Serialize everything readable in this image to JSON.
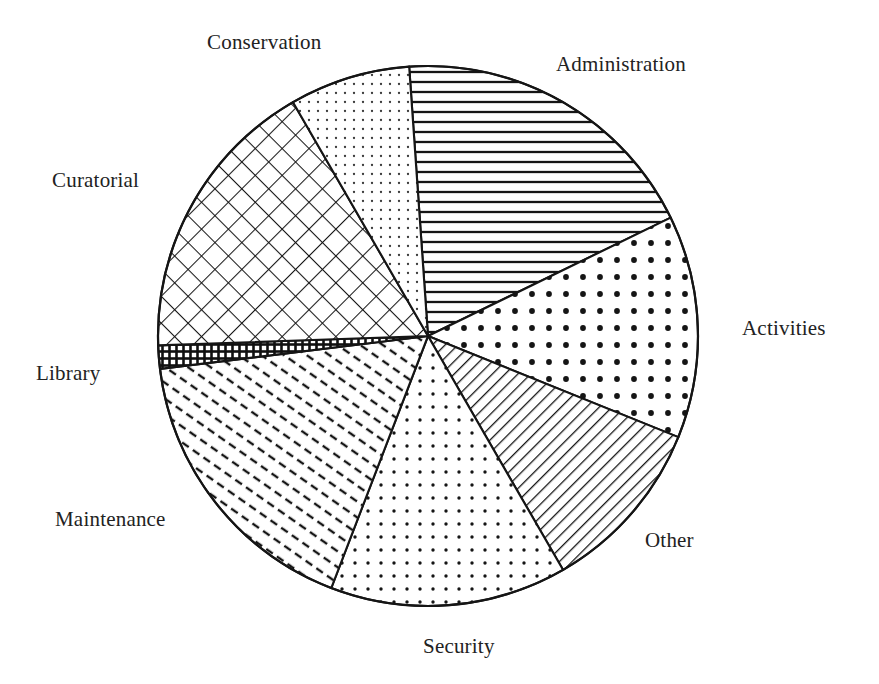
{
  "figure": {
    "background_color": "#ffffff",
    "ink_color": "#1a1a1a",
    "width": 879,
    "height": 684
  },
  "chart_data": {
    "type": "pie",
    "title": "",
    "subtitle": "",
    "xlabel": "",
    "ylabel": "",
    "legend_position": "none",
    "labels_position": "outside-around-pie",
    "grid": false,
    "center": [
      428,
      336
    ],
    "radius": 270,
    "start_angle_deg": 356,
    "direction": "clockwise",
    "categories": [
      "Administration",
      "Activities",
      "Other",
      "Security",
      "Maintenance",
      "Library",
      "Curatorial",
      "Conservation"
    ],
    "values": [
      19,
      13,
      11,
      14,
      17,
      1.5,
      17,
      7.5
    ],
    "value_unit": "percent",
    "slices": [
      {
        "label": "Administration",
        "value": 19,
        "start_deg": 356,
        "end_deg": 424,
        "sweep_deg": 68,
        "pattern": "horizontal-lines",
        "label_x": 556,
        "label_y": 52
      },
      {
        "label": "Activities",
        "value": 13,
        "start_deg": 424,
        "end_deg": 472,
        "sweep_deg": 48,
        "pattern": "large-dots",
        "label_x": 742,
        "label_y": 316
      },
      {
        "label": "Other",
        "value": 11,
        "start_deg": 472,
        "end_deg": 510,
        "sweep_deg": 38,
        "pattern": "diagonal-lines-up",
        "label_x": 645,
        "label_y": 528
      },
      {
        "label": "Security",
        "value": 14,
        "start_deg": 510,
        "end_deg": 561,
        "sweep_deg": 51,
        "pattern": "small-dots",
        "label_x": 423,
        "label_y": 634
      },
      {
        "label": "Maintenance",
        "value": 17,
        "start_deg": 561,
        "end_deg": 623,
        "sweep_deg": 62,
        "pattern": "dashed-diagonal",
        "label_x": 55,
        "label_y": 507
      },
      {
        "label": "Library",
        "value": 1.5,
        "start_deg": 623,
        "end_deg": 628,
        "sweep_deg": 5,
        "pattern": "dense-dark-grid",
        "label_x": 36,
        "label_y": 361
      },
      {
        "label": "Curatorial",
        "value": 17,
        "start_deg": 628,
        "end_deg": 690,
        "sweep_deg": 62,
        "pattern": "diagonal-crosshatch",
        "label_x": 52,
        "label_y": 168
      },
      {
        "label": "Conservation",
        "value": 7.5,
        "start_deg": 690,
        "end_deg": 716,
        "sweep_deg": 26,
        "pattern": "fine-dots",
        "label_x": 207,
        "label_y": 30
      }
    ]
  },
  "labels": {
    "administration": "Administration",
    "activities": "Activities",
    "other": "Other",
    "security": "Security",
    "maintenance": "Maintenance",
    "library": "Library",
    "curatorial": "Curatorial",
    "conservation": "Conservation"
  }
}
